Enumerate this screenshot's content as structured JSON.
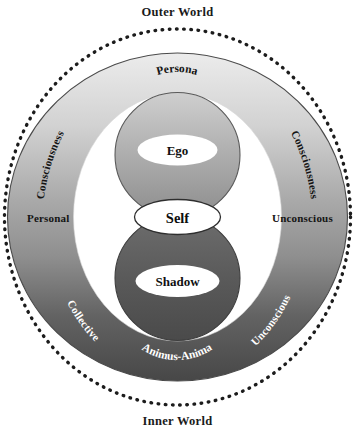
{
  "diagram": {
    "title_top": "Outer World",
    "title_bottom": "Inner World",
    "labels": {
      "consciousness_left": "Consciousness",
      "consciousness_right": "Consciousness",
      "personal": "Personal",
      "unconscious_right": "Unconscious",
      "collective": "Collective",
      "unconscious_bottom_right": "Unconscious",
      "persona": "Persona",
      "ego": "Ego",
      "self": "Self",
      "shadow": "Shadow",
      "animus_anima": "Animus-Anima"
    },
    "colors": {
      "background": "#ffffff",
      "outer_dotted_ring": "#1a1a1a",
      "gradient_light": "#e8e8e8",
      "gradient_mid": "#9a9a9a",
      "gradient_dark": "#4d4d4d",
      "inner_circle_light": "#b5b5b5",
      "inner_circle_dark": "#555555",
      "stroke": "#3a3a3a",
      "text_dark": "#141414",
      "text_light": "#ffffff",
      "white_field": "#ffffff"
    }
  }
}
